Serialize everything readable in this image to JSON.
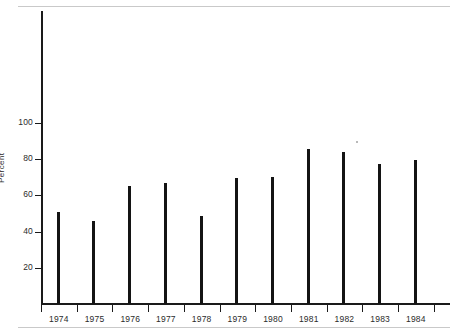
{
  "chart_data": {
    "type": "bar",
    "title": "",
    "subtitle": "",
    "xlabel": "",
    "ylabel": "Percent",
    "categories": [
      "1974",
      "1975",
      "1976",
      "1977",
      "1978",
      "1979",
      "1980",
      "1981",
      "1982",
      "1983",
      "1984"
    ],
    "values": [
      50.5,
      46,
      65,
      66.5,
      48.5,
      69.5,
      70,
      85.5,
      84,
      77,
      79.5
    ],
    "ylim": [
      0,
      135
    ],
    "xlim_labels": [
      "1974",
      "1984"
    ],
    "ytick_labels": [
      "20",
      "40",
      "60",
      "80",
      "100"
    ],
    "ytick_values": [
      20,
      40,
      60,
      80,
      100
    ],
    "grid": false,
    "legend": false,
    "legend_position": "none",
    "series": [
      {
        "name": "Percent",
        "values": [
          50.5,
          46,
          65,
          66.5,
          48.5,
          69.5,
          70,
          85.5,
          84,
          77,
          79.5
        ]
      }
    ],
    "bar_color": "#141414",
    "axis_color": "#1a1a1a",
    "background_color": "#ffffff"
  },
  "figure": {
    "axis_title_y": "Percent",
    "rule_color": "#c9c9c9"
  }
}
